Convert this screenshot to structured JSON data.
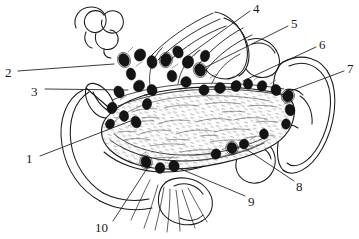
{
  "figure": {
    "type": "anatomical-line-drawing",
    "style": "black-and-white pen-and-ink hatching",
    "background_color": "#ffffff",
    "ink_color": "#1a1a1a",
    "node_fill_color": "#111111",
    "canvas": {
      "width": 359,
      "height": 239
    }
  },
  "callouts": [
    {
      "id": "1",
      "label": "1",
      "label_x": 26,
      "label_y": 152,
      "leader": {
        "x1": 40,
        "y1": 156,
        "x2": 133,
        "y2": 120
      }
    },
    {
      "id": "2",
      "label": "2",
      "label_x": 5,
      "label_y": 66,
      "leader": {
        "x1": 18,
        "y1": 71,
        "x2": 114,
        "y2": 64
      }
    },
    {
      "id": "3",
      "label": "3",
      "label_x": 31,
      "label_y": 85,
      "leader": {
        "x1": 45,
        "y1": 89,
        "x2": 128,
        "y2": 90
      }
    },
    {
      "id": "4",
      "label": "4",
      "label_x": 253,
      "label_y": 2,
      "leader": {
        "x1": 250,
        "y1": 11,
        "x2": 186,
        "y2": 57
      }
    },
    {
      "id": "5",
      "label": "5",
      "label_x": 291,
      "label_y": 17,
      "leader": {
        "x1": 288,
        "y1": 26,
        "x2": 200,
        "y2": 70
      }
    },
    {
      "id": "6",
      "label": "6",
      "label_x": 319,
      "label_y": 38,
      "leader": {
        "x1": 316,
        "y1": 47,
        "x2": 243,
        "y2": 81
      }
    },
    {
      "id": "7",
      "label": "7",
      "label_x": 347,
      "label_y": 62,
      "leader": {
        "x1": 344,
        "y1": 71,
        "x2": 288,
        "y2": 92
      }
    },
    {
      "id": "8",
      "label": "8",
      "label_x": 296,
      "label_y": 180,
      "leader": {
        "x1": 294,
        "y1": 181,
        "x2": 243,
        "y2": 147
      }
    },
    {
      "id": "9",
      "label": "9",
      "label_x": 248,
      "label_y": 195,
      "leader": {
        "x1": 245,
        "y1": 196,
        "x2": 176,
        "y2": 167
      }
    },
    {
      "id": "10",
      "label": "10",
      "label_x": 95,
      "label_y": 221,
      "leader": {
        "x1": 113,
        "y1": 221,
        "x2": 148,
        "y2": 167
      }
    }
  ]
}
